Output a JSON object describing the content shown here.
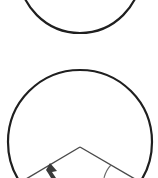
{
  "diagram": {
    "width": 158,
    "height": 178,
    "background": "#ffffff",
    "stroke_color": "#1f1f1f",
    "line_color": "#4a4a4a",
    "shapes": {
      "top_circle": {
        "cx": 80,
        "cy": -28,
        "r": 61,
        "stroke_width": 2.2,
        "description": "Bottom arc of a circle cut off at the top edge"
      },
      "bottom_circle": {
        "cx": 80,
        "cy": 142,
        "r": 72,
        "stroke_width": 2.2,
        "description": "Circle with an inscribed angle at its lower part"
      },
      "angle": {
        "apex": [
          80,
          147
        ],
        "left_end": [
          26,
          179
        ],
        "right_end": [
          135,
          179
        ],
        "stroke_width": 1.4,
        "description": "Two straight lines meeting at an apex near the circle center"
      },
      "arrow": {
        "tip": [
          50,
          164
        ],
        "description": "Filled arrowhead pointing up-left toward the left line"
      },
      "angle_arc": {
        "description": "Small arc marking the angle near the right line"
      }
    }
  }
}
